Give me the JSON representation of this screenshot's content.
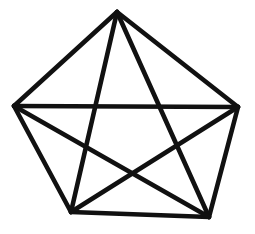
{
  "figure": {
    "background_color": "#ffffff",
    "stroke_color": "#111111",
    "stroke_width": 4.6,
    "canvas": {
      "width": 255,
      "height": 234
    }
  },
  "chart_data": {
    "type": "diagram",
    "shape": "complete-graph-K5",
    "title": "",
    "xlabel": "",
    "ylabel": "",
    "grid": false,
    "legend": "none",
    "xlim": [
      0,
      255
    ],
    "ylim": [
      0,
      234
    ],
    "vertex_count": 5,
    "edge_count": 10,
    "vertices": [
      {
        "id": "top",
        "label": "",
        "x": 117,
        "y": 12
      },
      {
        "id": "right",
        "label": "",
        "x": 238,
        "y": 107
      },
      {
        "id": "bottom-right",
        "label": "",
        "x": 209,
        "y": 217
      },
      {
        "id": "bottom-left",
        "label": "",
        "x": 71,
        "y": 212
      },
      {
        "id": "left",
        "label": "",
        "x": 14,
        "y": 106
      }
    ],
    "edges": [
      {
        "id": "edge-top-right",
        "kind": "perimeter",
        "from": "top",
        "to": "right",
        "x1": 117,
        "y1": 12,
        "x2": 238,
        "y2": 107
      },
      {
        "id": "edge-right-bottomright",
        "kind": "perimeter",
        "from": "right",
        "to": "bottom-right",
        "x1": 238,
        "y1": 107,
        "x2": 209,
        "y2": 217
      },
      {
        "id": "edge-bottomright-bottomleft",
        "kind": "perimeter",
        "from": "bottom-right",
        "to": "bottom-left",
        "x1": 209,
        "y1": 217,
        "x2": 71,
        "y2": 212
      },
      {
        "id": "edge-bottomleft-left",
        "kind": "perimeter",
        "from": "bottom-left",
        "to": "left",
        "x1": 71,
        "y1": 212,
        "x2": 14,
        "y2": 106
      },
      {
        "id": "edge-left-top",
        "kind": "perimeter",
        "from": "left",
        "to": "top",
        "x1": 14,
        "y1": 106,
        "x2": 117,
        "y2": 12
      },
      {
        "id": "diagonal-top-bottomleft",
        "kind": "diagonal",
        "from": "top",
        "to": "bottom-left",
        "x1": 117,
        "y1": 12,
        "x2": 71,
        "y2": 212
      },
      {
        "id": "diagonal-top-bottomright",
        "kind": "diagonal",
        "from": "top",
        "to": "bottom-right",
        "x1": 117,
        "y1": 12,
        "x2": 209,
        "y2": 217
      },
      {
        "id": "diagonal-left-right",
        "kind": "diagonal",
        "from": "left",
        "to": "right",
        "x1": 14,
        "y1": 106,
        "x2": 238,
        "y2": 107
      },
      {
        "id": "diagonal-left-bottomright",
        "kind": "diagonal",
        "from": "left",
        "to": "bottom-right",
        "x1": 14,
        "y1": 106,
        "x2": 209,
        "y2": 217
      },
      {
        "id": "diagonal-right-bottomleft",
        "kind": "diagonal",
        "from": "right",
        "to": "bottom-left",
        "x1": 238,
        "y1": 107,
        "x2": 71,
        "y2": 212
      }
    ]
  }
}
